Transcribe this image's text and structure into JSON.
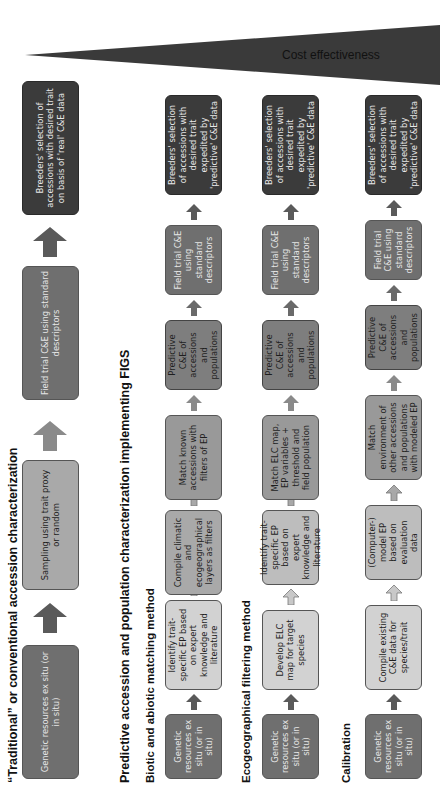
{
  "cost_bar": {
    "label": "Cost effectiveness",
    "color": "#3a3a3a"
  },
  "traditional": {
    "heading": "“Traditional” or conventional accession characterization",
    "steps": [
      "Genetic resources ex situ (or in situ)",
      "Sampling  using trait proxy or random",
      "Field trial C&E using standard descriptors",
      "Breeders' selection of accessions with desired trait on basis of 'real' C&E data"
    ]
  },
  "predictive": {
    "heading": "Predictive accession and population characterization implementing FIGS",
    "methods": [
      {
        "title": "Biotic and abiotic matching method",
        "steps": [
          "Genetic resources ex situ (or in situ)",
          "Identify trait-specific EP based on expert knowledge and literature",
          "Compile climatic and ecogeographical layers as filters",
          "Match known accessions with filters of EP",
          "Predictive C&E of accessions and populations",
          "Field trial C&E using standard descriptors",
          "Breeders' selection of accessions with desired trait  expedited by 'predictive' C&E data"
        ]
      },
      {
        "title": "Ecogeographical filtering method",
        "steps": [
          "Genetic resources ex situ (or in situ)",
          "Develop ELC map for target species",
          "Identify trait-specific EP based on expert knowledge and literature",
          "Match ELC map, EP variables + threshold and field population",
          "Predictive C&E of accessions and populations",
          "Field trial C&E using standard descriptors",
          "Breeders' selection of accessions with desired trait  expedited by 'predictive' C&E data"
        ]
      },
      {
        "title": "Calibration",
        "steps": [
          "Genetic resources ex situ (or in situ)",
          "Compile existing C&E data for species/trait",
          "(Computer-) model EP based on evaluation data",
          "Match environment of other accessions and populations with modeled EP",
          "Predictive C&E of accessions and populations",
          "Field trial C&E using standard descriptors",
          "Breeders' selection of accessions with desired trait  expedited by 'predictive' C&E data"
        ]
      }
    ]
  }
}
